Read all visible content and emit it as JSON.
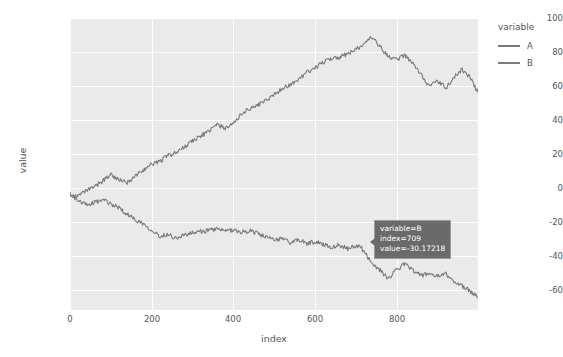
{
  "chart_data": {
    "type": "line",
    "title": "",
    "xlabel": "index",
    "ylabel": "value",
    "xlim": [
      0,
      999
    ],
    "ylim": [
      -68,
      103
    ],
    "grid": true,
    "legend_position": "right",
    "legend_title": "variable",
    "xticks": [
      0,
      200,
      400,
      600,
      800
    ],
    "yticks": [
      100,
      80,
      60,
      40,
      20,
      0,
      -20,
      -40,
      -60
    ],
    "series": [
      {
        "name": "A",
        "color": "#7a7a7a",
        "x": [
          0,
          20,
          40,
          60,
          80,
          100,
          120,
          140,
          160,
          180,
          200,
          220,
          240,
          260,
          280,
          300,
          320,
          340,
          360,
          380,
          400,
          420,
          440,
          460,
          480,
          500,
          520,
          540,
          560,
          580,
          600,
          620,
          640,
          660,
          680,
          700,
          720,
          740,
          760,
          780,
          800,
          820,
          840,
          860,
          880,
          900,
          920,
          940,
          960,
          980,
          999
        ],
        "values": [
          0,
          -1.5,
          1.8,
          4.2,
          7.5,
          11.5,
          8.0,
          6.5,
          10.5,
          14.0,
          17.5,
          19.0,
          22.5,
          24.0,
          27.5,
          31.0,
          34.0,
          36.5,
          40.5,
          38.5,
          41.0,
          47.0,
          50.0,
          52.0,
          55.0,
          58.0,
          62.0,
          64.0,
          67.0,
          71.0,
          74.0,
          77.0,
          79.5,
          80.0,
          82.0,
          84.5,
          88.0,
          91.5,
          86.0,
          80.0,
          79.0,
          81.0,
          76.0,
          70.0,
          63.0,
          66.0,
          62.0,
          68.0,
          73.0,
          68.0,
          59.5
        ]
      },
      {
        "name": "B",
        "color": "#7a7a7a",
        "x": [
          0,
          20,
          40,
          60,
          80,
          100,
          120,
          140,
          160,
          180,
          200,
          220,
          240,
          260,
          280,
          300,
          320,
          340,
          360,
          380,
          400,
          420,
          440,
          460,
          480,
          500,
          520,
          540,
          560,
          580,
          600,
          620,
          640,
          660,
          680,
          700,
          709,
          720,
          740,
          760,
          780,
          800,
          820,
          840,
          860,
          880,
          900,
          920,
          940,
          960,
          980,
          999
        ],
        "values": [
          0,
          -4.0,
          -6.5,
          -5.0,
          -3.5,
          -6.0,
          -8.0,
          -12.0,
          -15.0,
          -17.5,
          -21.0,
          -25.0,
          -23.5,
          -26.0,
          -24.0,
          -23.0,
          -22.0,
          -21.5,
          -20.5,
          -22.0,
          -21.0,
          -22.5,
          -21.5,
          -23.0,
          -25.5,
          -27.0,
          -26.0,
          -28.5,
          -27.0,
          -29.0,
          -28.0,
          -29.5,
          -31.0,
          -30.0,
          -32.0,
          -31.0,
          -30.17218,
          -34.0,
          -40.5,
          -45.0,
          -49.5,
          -44.5,
          -41.0,
          -44.5,
          -48.0,
          -46.5,
          -48.5,
          -47.0,
          -51.0,
          -54.0,
          -57.0,
          -60.5
        ]
      }
    ]
  },
  "chart": {
    "axes": {
      "x_title": "index",
      "y_title": "value",
      "x_tick_labels": [
        "0",
        "200",
        "400",
        "600",
        "800"
      ],
      "y_tick_labels": [
        "100",
        "80",
        "60",
        "40",
        "20",
        "0",
        "-20",
        "-40",
        "-60"
      ]
    },
    "legend": {
      "title": "variable",
      "items": [
        {
          "label": "A",
          "color": "#7a7a7a"
        },
        {
          "label": "B",
          "color": "#7a7a7a"
        }
      ]
    },
    "tooltip": {
      "line1": "variable=B",
      "line2": "index=709",
      "line3": "value=-30.17218",
      "background": "#6a6a6a",
      "text_color": "#ffffff"
    },
    "style": {
      "panel_background": "#eaeaea",
      "gridline_color": "#ffffff",
      "figure_background": "#ffffff",
      "text_color": "#555555"
    }
  }
}
